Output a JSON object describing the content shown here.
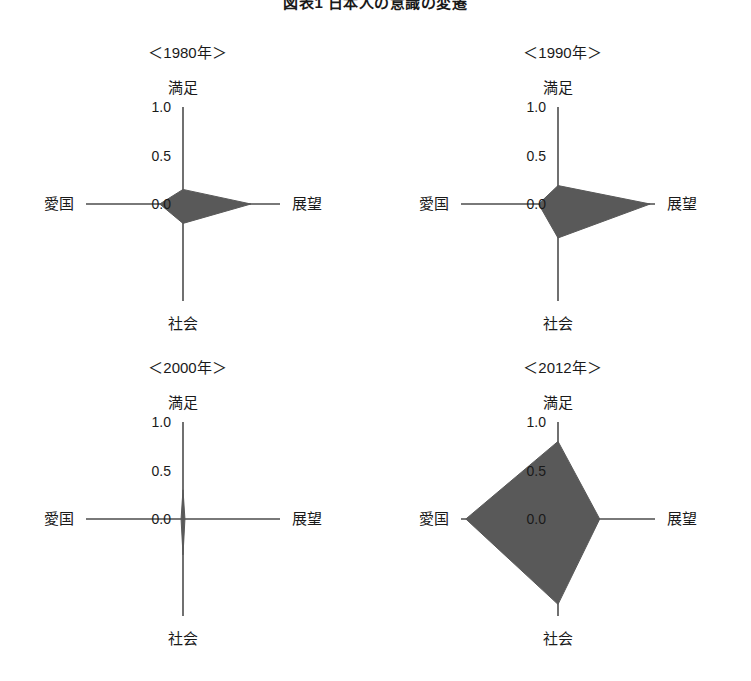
{
  "figure": {
    "title": "図表1 日本人の意識の変遷"
  },
  "chart_data": {
    "type": "radar",
    "title": "図表1 日本人の意識の変遷",
    "axes": [
      "満足",
      "展望",
      "社会",
      "愛国"
    ],
    "axis_positions": [
      "top",
      "right",
      "bottom",
      "left"
    ],
    "tick_labels": [
      "1.0",
      "0.5",
      "0.0"
    ],
    "tick_values": [
      1.0,
      0.5,
      0.0
    ],
    "rlim": [
      0.0,
      1.0
    ],
    "grid": false,
    "legend": "none",
    "fill_color": "#595959",
    "axis_color": "#4d4d4d",
    "panels": [
      {
        "label": "＜1980年＞",
        "year": 1980,
        "values": {
          "満足": 0.15,
          "展望": 0.7,
          "社会": 0.2,
          "愛国": 0.24
        }
      },
      {
        "label": "＜1990年＞",
        "year": 1990,
        "values": {
          "満足": 0.19,
          "展望": 0.95,
          "社会": 0.35,
          "愛国": 0.2
        }
      },
      {
        "label": "＜2000年＞",
        "year": 2000,
        "values": {
          "満足": 0.3,
          "展望": 0.02,
          "社会": 0.37,
          "愛国": 0.02
        }
      },
      {
        "label": "＜2012年＞",
        "year": 2012,
        "values": {
          "満足": 0.8,
          "展望": 0.43,
          "社会": 0.88,
          "愛国": 0.95
        }
      }
    ]
  }
}
